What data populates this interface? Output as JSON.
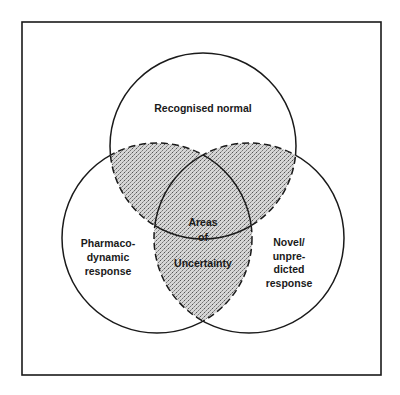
{
  "diagram": {
    "type": "venn",
    "sets": [
      {
        "id": "top",
        "label_lines": [
          "Recognised normal"
        ]
      },
      {
        "id": "left",
        "label_lines": [
          "Pharmaco-",
          "dynamic",
          "response"
        ]
      },
      {
        "id": "right",
        "label_lines": [
          "Novel/",
          "unpre-",
          "dicted",
          "response"
        ]
      }
    ],
    "center_label_lines": [
      "Areas",
      "of",
      "Uncertainty"
    ],
    "colors": {
      "line": "#1a1a1a",
      "shade": "#bdbdbd",
      "background": "#ffffff"
    }
  }
}
